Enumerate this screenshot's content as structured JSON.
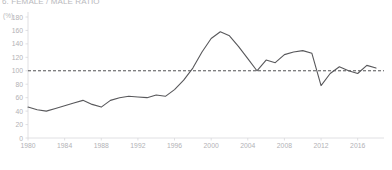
{
  "chart_data": {
    "type": "line",
    "title": "6. FEMALE / MALE RATIO",
    "subtitle": "",
    "xlabel": "",
    "ylabel": "",
    "y_unit_label": "(%)",
    "xlim": [
      1980,
      2018
    ],
    "ylim": [
      0,
      180
    ],
    "y_ticks": [
      0,
      20,
      40,
      60,
      80,
      100,
      120,
      140,
      160,
      180
    ],
    "x_ticks": [
      1980,
      1984,
      1988,
      1992,
      1996,
      2000,
      2004,
      2008,
      2012,
      2016
    ],
    "grid": false,
    "legend": null,
    "legend_position": "none",
    "line_color": "#58585b",
    "axis_color": "#d8d8dc",
    "tick_label_color": "#b2b2b6",
    "reference_line": {
      "value": 100,
      "style": "dashed",
      "color": "#3d3d40",
      "label": ""
    },
    "series": [
      {
        "name": "Female / Male ratio",
        "x": [
          1980,
          1981,
          1982,
          1983,
          1984,
          1985,
          1986,
          1987,
          1988,
          1989,
          1990,
          1991,
          1992,
          1993,
          1994,
          1995,
          1996,
          1997,
          1998,
          1999,
          2000,
          2001,
          2002,
          2003,
          2004,
          2005,
          2006,
          2007,
          2008,
          2009,
          2010,
          2011,
          2012,
          2013,
          2014,
          2015,
          2016,
          2017,
          2018
        ],
        "values": [
          46,
          42,
          40,
          44,
          48,
          52,
          56,
          50,
          46,
          56,
          60,
          62,
          61,
          60,
          64,
          62,
          72,
          86,
          104,
          128,
          148,
          158,
          152,
          136,
          118,
          100,
          116,
          112,
          124,
          128,
          130,
          126,
          78,
          96,
          106,
          100,
          96,
          108,
          104
        ]
      }
    ],
    "points_px": [
      [
        28,
        110
      ],
      [
        33,
        114
      ],
      [
        38,
        116
      ],
      [
        43,
        112
      ],
      [
        48,
        108
      ],
      [
        53,
        104
      ],
      [
        58,
        101
      ],
      [
        63,
        106
      ],
      [
        68,
        110
      ],
      [
        73,
        101
      ],
      [
        78,
        97
      ],
      [
        83,
        96
      ],
      [
        88,
        97
      ],
      [
        93,
        97
      ],
      [
        98,
        94
      ],
      [
        103,
        96
      ],
      [
        108,
        88
      ],
      [
        114,
        76
      ],
      [
        121,
        62
      ],
      [
        131,
        48
      ],
      [
        143,
        40
      ],
      [
        152,
        38
      ],
      [
        160,
        44
      ],
      [
        168,
        56
      ],
      [
        176,
        67
      ],
      [
        183,
        78
      ],
      [
        191,
        66
      ],
      [
        197,
        69
      ],
      [
        204,
        61
      ],
      [
        211,
        58
      ],
      [
        218,
        57
      ],
      [
        225,
        60
      ],
      [
        232,
        90
      ],
      [
        239,
        76
      ],
      [
        246,
        69
      ],
      [
        253,
        74
      ],
      [
        260,
        76
      ],
      [
        268,
        66
      ],
      [
        276,
        70
      ]
    ]
  }
}
